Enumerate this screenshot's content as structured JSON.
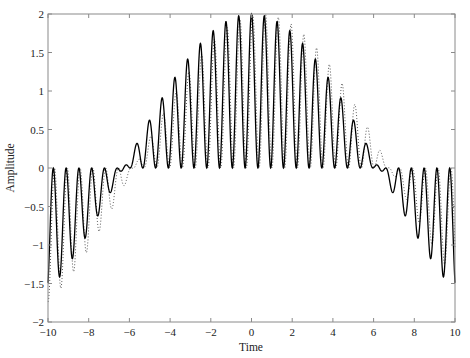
{
  "chart_data": {
    "type": "line",
    "title": "",
    "xlabel": "Time",
    "ylabel": "Amplitude",
    "xlim": [
      -10,
      10
    ],
    "ylim": [
      -2,
      2
    ],
    "grid": false,
    "legend": null,
    "xticks": [
      -10,
      -8,
      -6,
      -4,
      -2,
      0,
      2,
      4,
      6,
      8,
      10
    ],
    "xtick_labels": [
      "−10",
      "−8",
      "−6",
      "−4",
      "−2",
      "0",
      "2",
      "4",
      "6",
      "8",
      "10"
    ],
    "yticks": [
      -2,
      -1.5,
      -1,
      -0.5,
      0,
      0.5,
      1,
      1.5,
      2
    ],
    "ytick_labels": [
      "−2",
      "−1.5",
      "−1",
      "−0.5",
      "0",
      "0.5",
      "1",
      "1.5",
      "2"
    ],
    "series": [
      {
        "name": "solid",
        "style": "solid",
        "color": "#000000",
        "formula": "2*cos(t/4) * (1+cos(10*t))/2",
        "envelope_shift": 0,
        "phase_shift": 0,
        "key_values": [
          {
            "x": -10,
            "y": -1.6
          },
          {
            "x": -4,
            "y": 1.08
          },
          {
            "x": 0,
            "y": 2.0
          },
          {
            "x": 2,
            "y": 1.75
          },
          {
            "x": 10,
            "y": -1.6
          }
        ]
      },
      {
        "name": "dotted",
        "style": "dotted",
        "color": "#555555",
        "formula": "2*cos((t-0.5)/4) * (1+cos(10*(t-0.06)))/2",
        "envelope_shift": 0.5,
        "phase_shift": 0.06,
        "key_values": [
          {
            "x": -10,
            "y": -1.75
          },
          {
            "x": 2,
            "y": 1.87
          },
          {
            "x": 10,
            "y": -1.44
          }
        ]
      }
    ]
  }
}
